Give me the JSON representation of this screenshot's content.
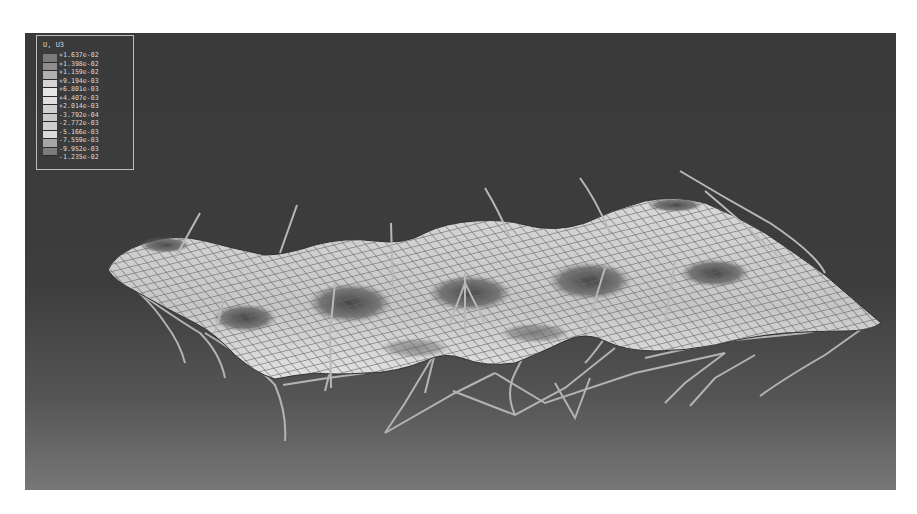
{
  "figure": {
    "type": "FEA contour plot (grayscale)",
    "viewport_background": [
      "#3a3a3a",
      "#777777"
    ]
  },
  "legend": {
    "title": "U, U3",
    "entries": [
      {
        "label": "+1.637e-02",
        "color": "#7a7a7a"
      },
      {
        "label": "+1.398e-02",
        "color": "#8e8e8e"
      },
      {
        "label": "+1.159e-02",
        "color": "#b0b0b0"
      },
      {
        "label": "+9.194e-03",
        "color": "#d4d4d4"
      },
      {
        "label": "+6.801e-03",
        "color": "#e6e6e6"
      },
      {
        "label": "+4.407e-03",
        "color": "#e0e0e0"
      },
      {
        "label": "+2.014e-03",
        "color": "#d0d0d0"
      },
      {
        "label": "-3.792e-04",
        "color": "#c8c8c8"
      },
      {
        "label": "-2.772e-03",
        "color": "#cfcfcf"
      },
      {
        "label": "-5.166e-03",
        "color": "#dadada"
      },
      {
        "label": "-7.559e-03",
        "color": "#a6a6a6"
      },
      {
        "label": "-9.952e-03",
        "color": "#7c7c7c"
      },
      {
        "label": "-1.235e-02",
        "color": "#6a6a6a"
      }
    ]
  },
  "scene": {
    "surface_fill": "#c9c9c9",
    "mesh_color": "#6b6b6b",
    "cable_color": "#b8b8b8",
    "depression_color": "#5a5a5a"
  }
}
